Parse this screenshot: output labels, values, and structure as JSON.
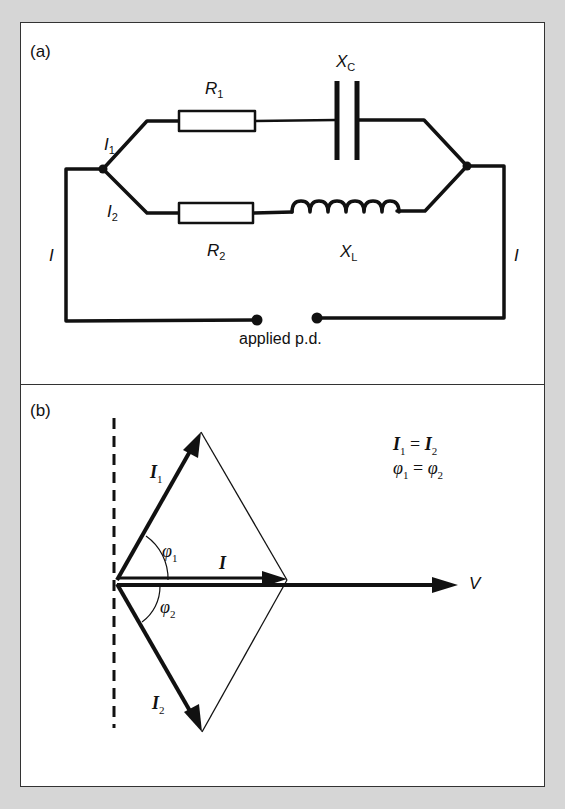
{
  "panel_a": {
    "label": "(a)",
    "components": {
      "R1": {
        "sym": "R",
        "sub": "1"
      },
      "R2": {
        "sym": "R",
        "sub": "2"
      },
      "XC": {
        "sym": "X",
        "sub": "C"
      },
      "XL": {
        "sym": "X",
        "sub": "L"
      }
    },
    "currents": {
      "I1": {
        "sym": "I",
        "sub": "1"
      },
      "I2": {
        "sym": "I",
        "sub": "2"
      },
      "I_left": "I",
      "I_right": "I"
    },
    "supply_label": "applied p.d."
  },
  "panel_b": {
    "label": "(b)",
    "phasors": {
      "I1": {
        "sym": "I",
        "sub": "1"
      },
      "I2": {
        "sym": "I",
        "sub": "2"
      },
      "I": "I",
      "V": "V",
      "phi1": {
        "sym": "φ",
        "sub": "1"
      },
      "phi2": {
        "sym": "φ",
        "sub": "2"
      }
    },
    "equations": {
      "eq1": {
        "lhs_sym": "I",
        "lhs_sub": "1",
        "op": " = ",
        "rhs_sym": "I",
        "rhs_sub": "2"
      },
      "eq2": {
        "lhs_sym": "φ",
        "lhs_sub": "1",
        "op": " = ",
        "rhs_sym": "φ",
        "rhs_sub": "2"
      }
    }
  },
  "colors": {
    "border": "#d6d6d6",
    "ink": "#111111",
    "paper": "#ffffff"
  }
}
